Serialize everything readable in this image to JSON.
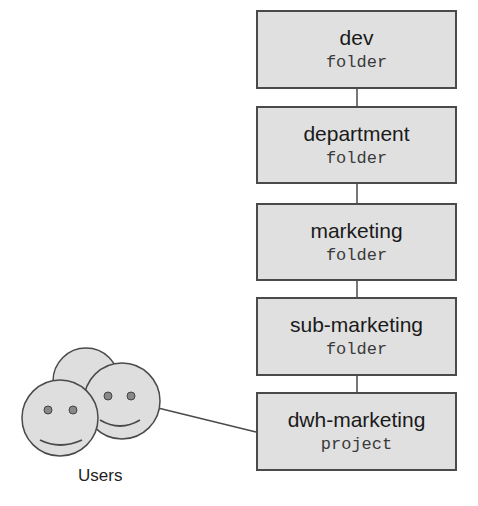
{
  "hierarchy": [
    {
      "name": "dev",
      "type": "folder"
    },
    {
      "name": "department",
      "type": "folder"
    },
    {
      "name": "marketing",
      "type": "folder"
    },
    {
      "name": "sub-marketing",
      "type": "folder"
    },
    {
      "name": "dwh-marketing",
      "type": "project"
    }
  ],
  "users": {
    "label": "Users",
    "icon": "users-group-smiley-icon",
    "connected_to": "dwh-marketing"
  },
  "colors": {
    "box_fill": "#e0e0e0",
    "stroke": "#4a4a4a",
    "face_fill": "#dedede"
  }
}
